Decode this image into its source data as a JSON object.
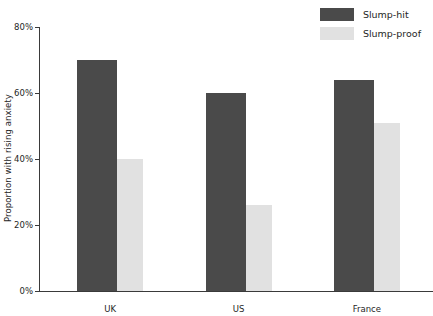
{
  "chart_data": {
    "type": "bar",
    "title": "",
    "subtitle": "",
    "xlabel": "",
    "ylabel": "Proportion with rising anxiety",
    "categories": [
      "UK",
      "US",
      "France"
    ],
    "series": [
      {
        "name": "Slump-hit",
        "color": "#4a4a4a",
        "values": [
          70,
          60,
          64
        ]
      },
      {
        "name": "Slump-proof",
        "color": "#e1e1e1",
        "values": [
          40,
          26,
          51
        ]
      }
    ],
    "ylim": [
      0,
      80
    ],
    "ytick_values": [
      0,
      20,
      40,
      60,
      80
    ],
    "ytick_labels": [
      "0%",
      "20%",
      "40%",
      "60%",
      "80%"
    ],
    "value_suffix": "%",
    "grid": false,
    "legend_position": "top-right",
    "orientation": "vertical",
    "grouping": "grouped"
  },
  "axes": {
    "y_axis_label": "Proportion with rising anxiety",
    "x_axis_label": ""
  },
  "legend": {
    "items": [
      {
        "label": "Slump-hit",
        "swatch": "hit"
      },
      {
        "label": "Slump-proof",
        "swatch": "proof"
      }
    ]
  },
  "colors": {
    "slump_hit": "#4a4a4a",
    "slump_proof": "#e1e1e1",
    "axis": "#3a3a3a",
    "text": "#262626",
    "background": "#ffffff"
  }
}
